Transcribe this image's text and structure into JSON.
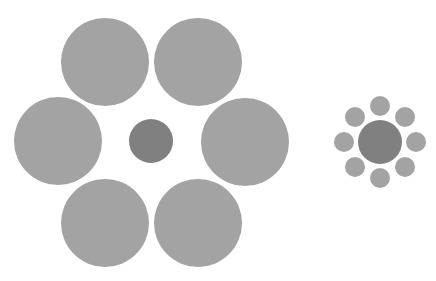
{
  "colors": {
    "background": "#ffffff",
    "surround": "#a3a3a3",
    "center": "#808080"
  },
  "groups": [
    {
      "name": "large-surround-group",
      "center": {
        "cx": 151,
        "cy": 141,
        "r": 22
      },
      "surround": [
        {
          "cx": 105,
          "cy": 62,
          "r": 44
        },
        {
          "cx": 198,
          "cy": 62,
          "r": 44
        },
        {
          "cx": 58,
          "cy": 141,
          "r": 44
        },
        {
          "cx": 245,
          "cy": 142,
          "r": 44
        },
        {
          "cx": 105,
          "cy": 223,
          "r": 44
        },
        {
          "cx": 198,
          "cy": 223,
          "r": 44
        }
      ]
    },
    {
      "name": "small-surround-group",
      "center": {
        "cx": 380,
        "cy": 142,
        "r": 22
      },
      "surround": [
        {
          "cx": 380,
          "cy": 106,
          "r": 10
        },
        {
          "cx": 405,
          "cy": 117,
          "r": 10
        },
        {
          "cx": 416,
          "cy": 142,
          "r": 10
        },
        {
          "cx": 405,
          "cy": 167,
          "r": 10
        },
        {
          "cx": 380,
          "cy": 178,
          "r": 10
        },
        {
          "cx": 355,
          "cy": 167,
          "r": 10
        },
        {
          "cx": 344,
          "cy": 142,
          "r": 10
        },
        {
          "cx": 355,
          "cy": 117,
          "r": 10
        }
      ]
    }
  ]
}
